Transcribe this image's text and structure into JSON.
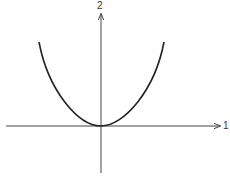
{
  "diagram": {
    "type": "coordinate-plot",
    "axes": {
      "horizontal_label": "1",
      "vertical_label": "2"
    },
    "curve": {
      "shape": "U-shaped (even power) curve with minimum at origin",
      "color": "#222222"
    },
    "axis_color": "#444444"
  }
}
